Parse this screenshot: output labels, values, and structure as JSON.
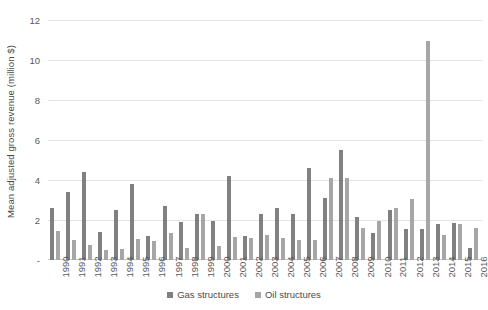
{
  "chart_data": {
    "type": "bar",
    "title": "",
    "xlabel": "",
    "ylabel": "Mean adjusted gross revenue (million $)",
    "ylim": [
      0,
      12
    ],
    "yticks": [
      "-",
      "2",
      "4",
      "6",
      "8",
      "10",
      "12"
    ],
    "ytick_values": [
      0,
      2,
      4,
      6,
      8,
      10,
      12
    ],
    "grid": true,
    "legend_position": "bottom",
    "categories": [
      "1990",
      "1991",
      "1992",
      "1993",
      "1994",
      "1995",
      "1996",
      "1997",
      "1998",
      "1999",
      "2000",
      "2001",
      "2002",
      "2003",
      "2004",
      "2005",
      "2006",
      "2007",
      "2008",
      "2009",
      "2010",
      "2011",
      "2012",
      "2013",
      "2014",
      "2015",
      "2016"
    ],
    "series": [
      {
        "name": "Gas structures",
        "color": "#808080",
        "values": [
          2.6,
          3.4,
          4.4,
          1.4,
          2.5,
          3.8,
          1.2,
          2.7,
          1.9,
          2.3,
          1.95,
          4.2,
          1.2,
          2.3,
          2.6,
          2.3,
          4.6,
          3.1,
          5.5,
          2.15,
          1.35,
          2.5,
          1.55,
          1.55,
          1.8,
          1.85,
          0.6
        ]
      },
      {
        "name": "Oil structures",
        "color": "#a6a6a6",
        "values": [
          1.45,
          1.0,
          0.75,
          0.5,
          0.55,
          1.05,
          0.95,
          1.35,
          0.6,
          2.3,
          0.7,
          1.15,
          1.1,
          1.25,
          1.1,
          1.0,
          1.0,
          4.1,
          4.1,
          1.6,
          1.95,
          2.6,
          3.05,
          10.95,
          1.25,
          1.8,
          1.6
        ]
      }
    ]
  },
  "legend": {
    "items": [
      {
        "label": "Gas structures",
        "color": "#808080"
      },
      {
        "label": "Oil structures",
        "color": "#a6a6a6"
      }
    ]
  }
}
